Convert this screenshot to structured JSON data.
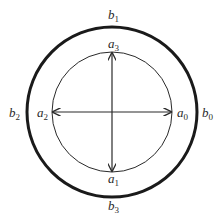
{
  "diagram": {
    "center": {
      "x": 112,
      "y": 112
    },
    "outer_circle": {
      "radius": 85,
      "stroke_width": 3,
      "color": "#1a1a1a"
    },
    "inner_circle": {
      "radius": 60,
      "stroke_width": 1,
      "color": "#2a2a2a"
    },
    "arrows": [
      {
        "name": "vertical-double-arrow",
        "from": "a_1",
        "to": "a_3"
      },
      {
        "name": "horizontal-double-arrow",
        "from": "a_2",
        "to": "a_0"
      }
    ],
    "labels": {
      "b1": {
        "base": "b",
        "sub": "1"
      },
      "b0": {
        "base": "b",
        "sub": "0"
      },
      "b2": {
        "base": "b",
        "sub": "2"
      },
      "b3": {
        "base": "b",
        "sub": "3"
      },
      "a3": {
        "base": "a",
        "sub": "3"
      },
      "a0": {
        "base": "a",
        "sub": "0"
      },
      "a2": {
        "base": "a",
        "sub": "2"
      },
      "a1": {
        "base": "a",
        "sub": "1"
      }
    }
  }
}
